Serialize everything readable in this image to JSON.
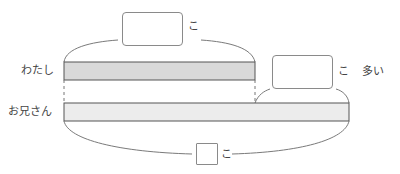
{
  "diagram": {
    "type": "tape-diagram",
    "rows": [
      {
        "label": "わたし",
        "bar_fill": "#d9d9d9"
      },
      {
        "label": "お兄さん",
        "bar_fill": "#ececec"
      }
    ],
    "top_answer": {
      "value": "",
      "unit": "こ"
    },
    "difference_answer": {
      "value": "",
      "unit": "こ",
      "suffix": "多い"
    },
    "total_answer": {
      "value": "",
      "unit": "こ"
    }
  },
  "colors": {
    "stroke": "#555555",
    "brace": "#7a7a7a",
    "box_border": "#8a8a8a"
  }
}
